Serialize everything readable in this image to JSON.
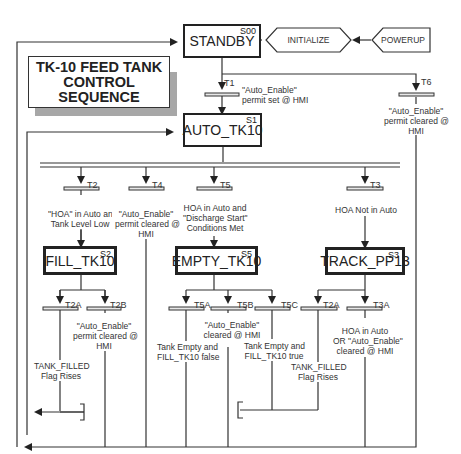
{
  "title": {
    "lines": [
      "TK-10 FEED TANK",
      "CONTROL",
      "SEQUENCE"
    ]
  },
  "entry": {
    "initialize": "INITIALIZE",
    "powerup": "POWERUP"
  },
  "steps": {
    "standby": {
      "name": "STANDBY",
      "id": "S00"
    },
    "auto": {
      "name": "AUTO_TK10",
      "id": "S1"
    },
    "fill": {
      "name": "FILL_TK10",
      "id": "S2"
    },
    "empty": {
      "name": "EMPTY_TK10",
      "id": "S5"
    },
    "track": {
      "name": "TRACK_PP13",
      "id": "S3"
    }
  },
  "transitions": {
    "t1": {
      "id": "T1",
      "cond": [
        "\"Auto_Enable\"",
        "permit set @ HMI"
      ]
    },
    "t6": {
      "id": "T6",
      "cond": [
        "\"Auto_Enable\"",
        "permit cleared @",
        "HMI"
      ]
    },
    "t2": {
      "id": "T2",
      "cond": [
        "\"HOA\" in Auto and",
        "Tank Level Low"
      ]
    },
    "t4": {
      "id": "T4",
      "cond": [
        "\"Auto_Enable\"",
        "permit cleared @",
        "HMI"
      ]
    },
    "t5": {
      "id": "T5",
      "cond": [
        "HOA in Auto and",
        "\"Discharge Start\"",
        "Conditions Met"
      ]
    },
    "t3": {
      "id": "T3",
      "cond": [
        "HOA Not in Auto"
      ]
    },
    "t2a": {
      "id": "T2A",
      "cond": [
        "TANK_FILLED",
        "Flag Rises"
      ]
    },
    "t2b": {
      "id": "T2B",
      "cond": [
        "\"Auto_Enable\"",
        "permit cleared @",
        "HMI"
      ]
    },
    "t5a": {
      "id": "T5A",
      "cond": [
        "Tank Empty and",
        "FILL_TK10 false"
      ]
    },
    "t5b": {
      "id": "T5B",
      "cond": [
        "\"Auto_Enable\"",
        "cleared @ HMI"
      ]
    },
    "t5c": {
      "id": "T5C",
      "cond": [
        "Tank Empty and",
        "FILL_TK10 true"
      ]
    },
    "t2a_track": {
      "id": "T2A",
      "cond": [
        "TANK_FILLED",
        "Flag Rises"
      ]
    },
    "t3a": {
      "id": "T3A",
      "cond": [
        "HOA in Auto",
        "OR \"Auto_Enable\"",
        "cleared @ HMI"
      ]
    }
  },
  "colors": {
    "line": "#333333",
    "shadow": "#a7a7a7",
    "background": "#ffffff"
  }
}
